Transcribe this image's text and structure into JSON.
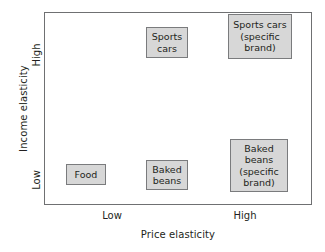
{
  "chart_data": {
    "type": "scatter",
    "title": "",
    "xlabel": "Price elasticity",
    "ylabel": "Income elasticity",
    "grid": false,
    "legend": "none",
    "x_ticks": [
      "Low",
      "High"
    ],
    "y_ticks": [
      "Low",
      "High"
    ],
    "xlim": [
      "Low",
      "High"
    ],
    "ylim": [
      "Low",
      "High"
    ],
    "points": [
      {
        "label": "Food",
        "price_elasticity": "Low",
        "income_elasticity": "Low",
        "x": 0.15,
        "y": 0.12
      },
      {
        "label": "Baked\nbeans",
        "price_elasticity": "Low",
        "income_elasticity": "Low",
        "x": 0.45,
        "y": 0.15
      },
      {
        "label": "Sports\ncars",
        "price_elasticity": "Low",
        "income_elasticity": "High",
        "x": 0.45,
        "y": 0.85
      },
      {
        "label": "Sports cars\n(specific\nbrand)",
        "price_elasticity": "High",
        "income_elasticity": "High",
        "x": 0.8,
        "y": 0.9
      },
      {
        "label": "Baked\nbeans\n(specific\nbrand)",
        "price_elasticity": "High",
        "income_elasticity": "Low",
        "x": 0.8,
        "y": 0.25
      }
    ]
  },
  "axes": {
    "y_title": "Income elasticity",
    "x_title": "Price elasticity",
    "y_tick_high": "High",
    "y_tick_low": "Low",
    "x_tick_low": "Low",
    "x_tick_high": "High"
  },
  "boxes": {
    "food": "Food",
    "baked_beans": "Baked\nbeans",
    "sports_cars": "Sports\ncars",
    "sports_cars_brand": "Sports cars\n(specific\nbrand)",
    "baked_beans_brand": "Baked\nbeans\n(specific\nbrand)"
  },
  "colors": {
    "box_fill": "#d7d7d7",
    "box_border": "#7a7b7d",
    "frame_border": "#6f7072",
    "text": "#231f20",
    "background": "#ffffff"
  }
}
